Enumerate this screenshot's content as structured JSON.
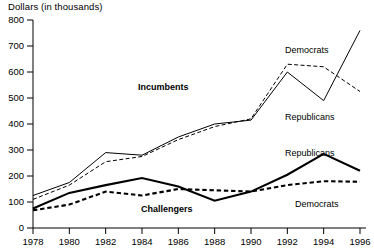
{
  "chart_data": {
    "type": "line",
    "title": "Dollars (in thousands)",
    "xlabel": "",
    "ylabel": "Dollars (in thousands)",
    "x": [
      1978,
      1980,
      1982,
      1984,
      1986,
      1988,
      1990,
      1992,
      1994,
      1996
    ],
    "xtick_labels": [
      "1978",
      "1980",
      "1982",
      "1984",
      "1986",
      "1988",
      "1990",
      "1992",
      "1994",
      "1996"
    ],
    "ytick_labels": [
      "0",
      "100",
      "200",
      "300",
      "400",
      "500",
      "600",
      "700",
      "800"
    ],
    "yticks": [
      0,
      100,
      200,
      300,
      400,
      500,
      600,
      700,
      800
    ],
    "ylim": [
      0,
      800
    ],
    "xlim": [
      1978,
      1996
    ],
    "grid": false,
    "legend_position": "inline-annotations",
    "series": [
      {
        "name": "Incumbents Republicans",
        "label": "Republicans",
        "group": "Incumbents",
        "style": "thin-solid",
        "color": "#000000",
        "values": [
          125,
          175,
          290,
          280,
          350,
          400,
          415,
          600,
          490,
          760
        ]
      },
      {
        "name": "Incumbents Democrats",
        "label": "Democrats",
        "group": "Incumbents",
        "style": "thin-dashed",
        "color": "#000000",
        "values": [
          110,
          165,
          255,
          275,
          340,
          390,
          420,
          630,
          620,
          525
        ]
      },
      {
        "name": "Challengers Republicans",
        "label": "Republicans",
        "group": "Challengers",
        "style": "thick-solid",
        "color": "#000000",
        "values": [
          75,
          135,
          165,
          192,
          160,
          105,
          140,
          205,
          285,
          220
        ]
      },
      {
        "name": "Challengers Democrats",
        "label": "Democrats",
        "group": "Challengers",
        "style": "thick-dashed",
        "color": "#000000",
        "values": [
          68,
          90,
          140,
          125,
          150,
          145,
          140,
          165,
          180,
          178
        ]
      }
    ],
    "annotations": [
      {
        "text": "Incumbents",
        "kind": "group-label"
      },
      {
        "text": "Challengers",
        "kind": "group-label"
      },
      {
        "text": "Democrats",
        "kind": "series-label",
        "group": "Incumbents"
      },
      {
        "text": "Republicans",
        "kind": "series-label",
        "group": "Incumbents"
      },
      {
        "text": "Republicans",
        "kind": "series-label",
        "group": "Challengers"
      },
      {
        "text": "Democrats",
        "kind": "series-label",
        "group": "Challengers"
      }
    ]
  }
}
